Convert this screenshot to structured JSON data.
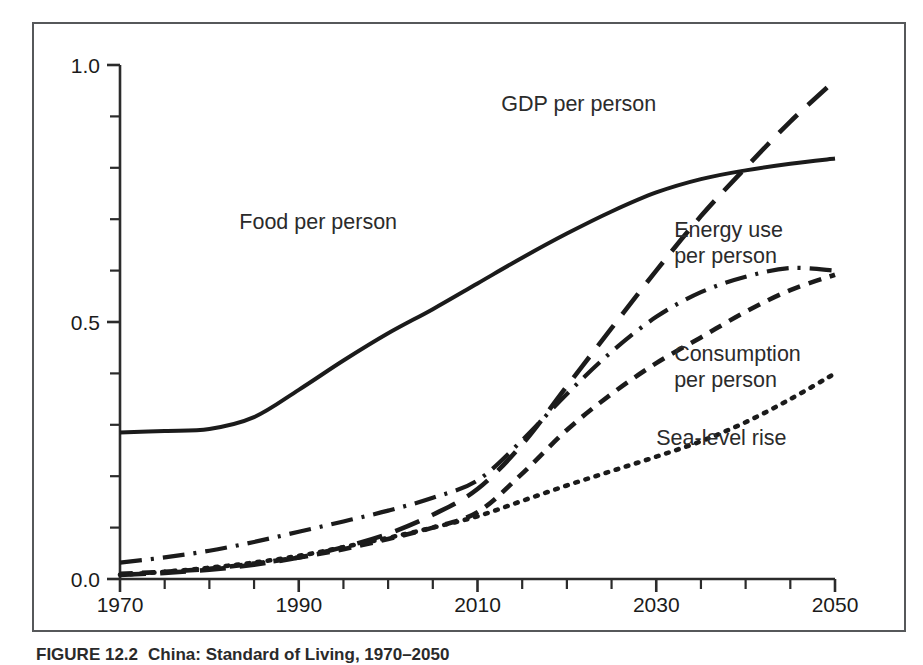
{
  "figure": {
    "caption_number": "FIGURE 12.2",
    "caption_title": "China: Standard of Living, 1970–2050"
  },
  "chart_data": {
    "type": "line",
    "title": "",
    "subtitle": "",
    "xlabel": "",
    "ylabel": "",
    "xlim": [
      1970,
      2050
    ],
    "ylim": [
      0.0,
      1.0
    ],
    "grid": false,
    "legend_position": "inline-annotations",
    "x_ticks_major": [
      1970,
      1990,
      2010,
      2030,
      2050
    ],
    "x_tick_labels": [
      "1970",
      "1990",
      "2010",
      "2030",
      "2050"
    ],
    "x_ticks_minor_step": 5,
    "y_ticks_major": [
      0.0,
      0.5,
      1.0
    ],
    "y_tick_labels": [
      "0.0",
      "0.5",
      "1.0"
    ],
    "y_ticks_minor_step": 0.1,
    "x": [
      1970,
      1975,
      1980,
      1985,
      1990,
      1995,
      2000,
      2005,
      2010,
      2015,
      2020,
      2025,
      2030,
      2035,
      2040,
      2045,
      2050
    ],
    "series": [
      {
        "name": "Food per person",
        "style": "solid",
        "label_x": 2001,
        "label_y": 0.695,
        "values": [
          0.285,
          0.288,
          0.292,
          0.315,
          0.368,
          0.425,
          0.478,
          0.525,
          0.575,
          0.625,
          0.672,
          0.715,
          0.752,
          0.778,
          0.795,
          0.808,
          0.818
        ]
      },
      {
        "name": "GDP per person",
        "style": "long-dash",
        "label_x": 2030,
        "label_y": 0.925,
        "values": [
          0.008,
          0.012,
          0.018,
          0.028,
          0.042,
          0.062,
          0.088,
          0.125,
          0.175,
          0.262,
          0.375,
          0.488,
          0.6,
          0.706,
          0.8,
          0.89,
          0.97
        ]
      },
      {
        "name": "Energy use per person",
        "style": "dash-dot",
        "label_x": 2032,
        "label_y": 0.665,
        "values": [
          0.032,
          0.042,
          0.055,
          0.072,
          0.092,
          0.112,
          0.133,
          0.158,
          0.192,
          0.27,
          0.36,
          0.442,
          0.51,
          0.558,
          0.588,
          0.605,
          0.6
        ]
      },
      {
        "name": "Consumption per person",
        "style": "short-dash",
        "label_x": 2032,
        "label_y": 0.425,
        "values": [
          0.01,
          0.014,
          0.02,
          0.03,
          0.042,
          0.058,
          0.078,
          0.1,
          0.13,
          0.205,
          0.29,
          0.36,
          0.42,
          0.47,
          0.52,
          0.562,
          0.592
        ]
      },
      {
        "name": "Sea-level rise",
        "style": "dotted",
        "label_x": 2030,
        "label_y": 0.275,
        "values": [
          0.008,
          0.014,
          0.022,
          0.032,
          0.045,
          0.062,
          0.08,
          0.1,
          0.122,
          0.152,
          0.182,
          0.21,
          0.238,
          0.268,
          0.305,
          0.35,
          0.4
        ]
      }
    ]
  },
  "labels": {
    "gdp": "GDP per person",
    "food": "Food per person",
    "energy_line1": "Energy use",
    "energy_line2": "per person",
    "consumption_line1": "Consumption",
    "consumption_line2": "per person",
    "sea_level": "Sea-level rise"
  },
  "colors": {
    "line": "#1b1b1b",
    "axis": "#2b2b2b",
    "frame": "#56585a",
    "background": "#ffffff"
  }
}
